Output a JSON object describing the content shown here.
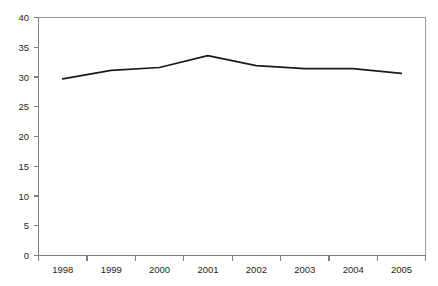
{
  "chart_data": {
    "type": "line",
    "title": "",
    "subtitle": "",
    "xlabel": "",
    "ylabel": "",
    "categories": [
      "1998",
      "1999",
      "2000",
      "2001",
      "2002",
      "2003",
      "2004",
      "2005"
    ],
    "series": [
      {
        "name": "series-1",
        "color": "#1a1a1a",
        "values": [
          29.7,
          31.1,
          31.6,
          33.6,
          31.9,
          31.4,
          31.4,
          30.6
        ]
      }
    ],
    "ylim": [
      0,
      40
    ],
    "y_ticks": [
      0,
      5,
      10,
      15,
      20,
      25,
      30,
      35,
      40
    ],
    "y_tick_labels": [
      "0",
      "5",
      "10",
      "15",
      "20",
      "25",
      "30",
      "35",
      "40"
    ],
    "x_tick_labels": [
      "1998",
      "1999",
      "2000",
      "2001",
      "2002",
      "2003",
      "2004",
      "2005"
    ],
    "grid": false,
    "legend": false,
    "legend_position": "none",
    "annotations": []
  },
  "axes": {
    "y_axis_color": "#808080",
    "x_axis_color": "#808080",
    "frame_color": "#9a9a9a",
    "label_color": "#231f20"
  }
}
